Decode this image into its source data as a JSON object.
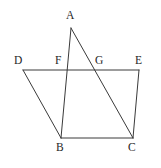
{
  "figure": {
    "name": "geometry-figure-quadrilateral-with-cevians",
    "background_color": "#ffffff",
    "line_color": "#3a3a3a",
    "label_color": "#262626",
    "width": 161,
    "height": 168
  },
  "points": {
    "A": {
      "label": "A",
      "x": 71,
      "y": 28,
      "label_x": 66,
      "label_y": 10
    },
    "B": {
      "label": "B",
      "x": 61,
      "y": 138,
      "label_x": 56,
      "label_y": 142
    },
    "C": {
      "label": "C",
      "x": 133,
      "y": 138,
      "label_x": 128,
      "label_y": 142
    },
    "D": {
      "label": "D",
      "x": 23,
      "y": 70,
      "label_x": 14,
      "label_y": 55
    },
    "E": {
      "label": "E",
      "x": 139,
      "y": 70,
      "label_x": 135,
      "label_y": 55
    },
    "F": {
      "label": "F",
      "x": 68,
      "y": 70,
      "label_x": 55,
      "label_y": 55
    },
    "G": {
      "label": "G",
      "x": 96,
      "y": 70,
      "label_x": 95,
      "label_y": 55
    }
  },
  "segments": [
    {
      "name": "segment-DE",
      "from": "D",
      "to": "E",
      "path": "M 23 70 L 139 70"
    },
    {
      "name": "segment-BC",
      "from": "B",
      "to": "C",
      "path": "M 61 138 L 133 138"
    },
    {
      "name": "segment-AB",
      "from": "A",
      "to": "B",
      "path": "M 71 28 L 61 138"
    },
    {
      "name": "segment-AC",
      "from": "A",
      "to": "C",
      "path": "M 71 28 L 133 138"
    },
    {
      "name": "segment-DB",
      "from": "D",
      "to": "B",
      "path": "M 23 70 L 61 138"
    },
    {
      "name": "segment-EC",
      "from": "E",
      "to": "C",
      "path": "M 139 70 L 133 138"
    }
  ]
}
